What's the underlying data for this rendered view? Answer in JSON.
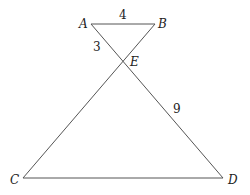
{
  "diagram": {
    "type": "geometry",
    "points": {
      "A": {
        "label": "A",
        "x": 91,
        "y": 24
      },
      "B": {
        "label": "B",
        "x": 155,
        "y": 24
      },
      "E": {
        "label": "E",
        "x": 124,
        "y": 61
      },
      "C": {
        "label": "C",
        "x": 23,
        "y": 178
      },
      "D": {
        "label": "D",
        "x": 223,
        "y": 178
      }
    },
    "segments": [
      {
        "from": "A",
        "to": "B"
      },
      {
        "from": "A",
        "to": "D"
      },
      {
        "from": "B",
        "to": "C"
      },
      {
        "from": "C",
        "to": "D"
      }
    ],
    "measurements": {
      "AB": "4",
      "AE": "3",
      "ED": "9"
    },
    "line_color": "#555555"
  }
}
